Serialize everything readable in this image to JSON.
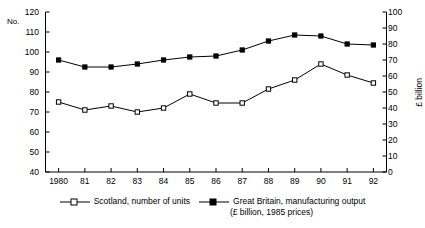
{
  "chart_data": {
    "type": "line",
    "title": "",
    "xlabel": "",
    "categories": [
      "1980",
      "81",
      "82",
      "83",
      "84",
      "85",
      "86",
      "87",
      "88",
      "89",
      "90",
      "91",
      "92"
    ],
    "grid": false,
    "legend_position": "bottom",
    "axes": {
      "left": {
        "label": "No.",
        "ticks": [
          "120",
          "110",
          "100",
          "90",
          "80",
          "70",
          "60",
          "50",
          "40"
        ],
        "min": 40,
        "max": 120,
        "step": 10
      },
      "right": {
        "label": "£ billion",
        "ticks": [
          "100",
          "90",
          "80",
          "70",
          "60",
          "50",
          "40",
          "30",
          "20",
          "10",
          "0"
        ],
        "min": 0,
        "max": 100,
        "step": 10
      }
    },
    "series": [
      {
        "name": "Scotland, number of units",
        "axis": "left",
        "marker": "open-square",
        "values": [
          75,
          71,
          73,
          70,
          72,
          79,
          74.5,
          74.5,
          81.5,
          86,
          94,
          88.5,
          84.5
        ]
      },
      {
        "name": "Great Britain, manufacturing output",
        "axis": "right",
        "marker": "filled-square",
        "values": [
          70,
          66,
          66,
          67.5,
          70,
          72,
          72.5,
          76,
          81.5,
          85.5,
          85,
          80,
          79.5
        ],
        "left_axis_positions": [
          96,
          92.5,
          92.5,
          94,
          96,
          97.5,
          98,
          101,
          105.5,
          108.5,
          108,
          104,
          103.5
        ]
      }
    ]
  },
  "legend": {
    "entries": [
      {
        "label": "Scotland, number of units",
        "sub": ""
      },
      {
        "label": "Great Britain, manufacturing output",
        "sub": "(£ billion, 1985 prices)"
      }
    ]
  },
  "colors": {
    "axis": "#000000",
    "series1": "#000000",
    "series2": "#000000",
    "background": "#ffffff"
  }
}
